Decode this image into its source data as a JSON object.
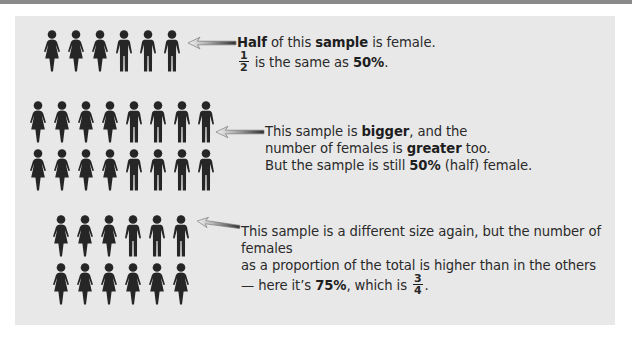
{
  "colors": {
    "panel_bg": "#e8e8e8",
    "figure": "#262626",
    "text": "#2a2a2a",
    "top_bar": "#8a8a8a"
  },
  "icons": {
    "female": "female-figure-icon",
    "male": "male-figure-icon",
    "arrow": "left-arrow-icon"
  },
  "examples": [
    {
      "rows": [
        [
          "F",
          "F",
          "F",
          "M",
          "M",
          "M"
        ]
      ],
      "female_count": 3,
      "total": 6,
      "text": {
        "l1_b1": "Half",
        "l1_t1": " of this ",
        "l1_b2": "sample",
        "l1_t2": " is female.",
        "frac_num": "1",
        "frac_den": "2",
        "l2_t1": " is the same as ",
        "l2_b1": "50%",
        "l2_t2": "."
      }
    },
    {
      "rows": [
        [
          "F",
          "F",
          "F",
          "F",
          "M",
          "M",
          "M",
          "M"
        ],
        [
          "F",
          "F",
          "F",
          "F",
          "M",
          "M",
          "M",
          "M"
        ]
      ],
      "female_count": 8,
      "total": 16,
      "text": {
        "l1_t1": "This sample is ",
        "l1_b1": "bigger",
        "l1_t2": ", and the",
        "l2_t1": "number of females is ",
        "l2_b1": "greater",
        "l2_t2": " too.",
        "l3_t1": "But the sample is still ",
        "l3_b1": "50%",
        "l3_t2": " (half) female."
      }
    },
    {
      "rows": [
        [
          "F",
          "F",
          "F",
          "M",
          "M",
          "M"
        ],
        [
          "F",
          "F",
          "F",
          "F",
          "F",
          "F"
        ]
      ],
      "female_count": 9,
      "total": 12,
      "text": {
        "l1": "This sample is a different size again, but the number of females",
        "l2": "as a proportion of the total is higher than in the others",
        "l3_t1": "— here it’s ",
        "l3_b1": "75%",
        "l3_t2": ", which is ",
        "frac_num": "3",
        "frac_den": "4",
        "l3_t3": "."
      }
    }
  ]
}
